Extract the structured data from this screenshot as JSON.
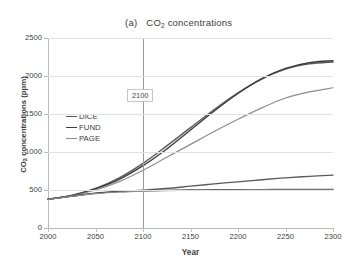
{
  "figure": {
    "panel_label": "(a)",
    "title_main": "CO",
    "title_sub": "2",
    "title_rest": " concentrations",
    "background": "#ffffff"
  },
  "annotation": {
    "marker_label": "2100",
    "marker_year": 2100,
    "marker_line_color": "#9a9a9a",
    "box_border_color": "#c6c6c6"
  },
  "axis": {
    "y_title_main": "CO",
    "y_title_sub": "2",
    "y_title_rest": " concentrations (ppm)",
    "x_title": "Year",
    "y_ticks": [
      "0",
      "500",
      "1000",
      "1500",
      "2000",
      "2500"
    ],
    "x_ticks": [
      "2000",
      "2050",
      "2100",
      "2150",
      "2200",
      "2250",
      "2300"
    ]
  },
  "legend": {
    "position": "inside-upper-left",
    "entries": [
      {
        "label": "DICE",
        "color": "#5a5a5a"
      },
      {
        "label": "FUND",
        "color": "#3c3c3c"
      },
      {
        "label": "PAGE",
        "color": "#8e8e8e"
      }
    ]
  },
  "chart_data": {
    "type": "line",
    "xlabel": "Year",
    "ylabel": "CO2 concentrations (ppm)",
    "xlim": [
      2000,
      2300
    ],
    "ylim": [
      0,
      2500
    ],
    "ytick_step": 500,
    "xtick_step": 50,
    "grid": "horizontal",
    "legend_position": "inside-upper-left",
    "x": [
      2000,
      2025,
      2050,
      2075,
      2100,
      2125,
      2150,
      2175,
      2200,
      2225,
      2250,
      2275,
      2300
    ],
    "series": [
      {
        "name": "DICE high (BAU)",
        "model": "DICE",
        "scenario": "business-as-usual",
        "color": "#5a5a5a",
        "width": 1.4,
        "values": [
          380,
          430,
          520,
          660,
          850,
          1080,
          1320,
          1560,
          1780,
          1960,
          2090,
          2160,
          2185
        ]
      },
      {
        "name": "FUND high (BAU)",
        "model": "FUND",
        "scenario": "business-as-usual",
        "color": "#3c3c3c",
        "width": 1.4,
        "values": [
          378,
          428,
          515,
          640,
          820,
          1040,
          1290,
          1540,
          1770,
          1965,
          2100,
          2175,
          2200
        ]
      },
      {
        "name": "PAGE high (BAU)",
        "model": "PAGE",
        "scenario": "business-as-usual",
        "color": "#8e8e8e",
        "width": 1.2,
        "values": [
          376,
          424,
          500,
          610,
          760,
          930,
          1100,
          1270,
          1430,
          1580,
          1710,
          1790,
          1845
        ]
      },
      {
        "name": "DICE low (optimal)",
        "model": "DICE",
        "scenario": "optimal policy",
        "color": "#5a5a5a",
        "width": 1.3,
        "values": [
          380,
          420,
          460,
          483,
          498,
          520,
          550,
          580,
          608,
          635,
          660,
          680,
          695
        ]
      },
      {
        "name": "FUND low (optimal)",
        "model": "FUND",
        "scenario": "optimal policy",
        "color": "#3c3c3c",
        "width": 1.3,
        "values": [
          378,
          418,
          455,
          478,
          490,
          496,
          500,
          503,
          505,
          506,
          507,
          508,
          508
        ]
      },
      {
        "name": "PAGE low (optimal)",
        "model": "PAGE",
        "scenario": "optimal policy",
        "color": "#8e8e8e",
        "width": 1.2,
        "values": [
          376,
          416,
          452,
          474,
          486,
          492,
          496,
          498,
          500,
          501,
          502,
          503,
          503
        ]
      }
    ]
  }
}
